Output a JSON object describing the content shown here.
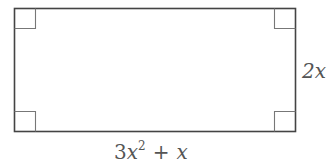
{
  "diagram": {
    "shape": "rectangle",
    "right_angle_markers": 4,
    "labels": {
      "width": {
        "coef": "3",
        "var": "x",
        "exp": "2",
        "op": "+",
        "term": "x"
      },
      "height": "2x"
    },
    "colors": {
      "stroke": "#444444",
      "marker": "#777777",
      "text": "#555555"
    }
  }
}
